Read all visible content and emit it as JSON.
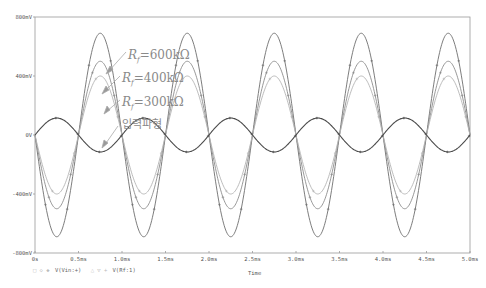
{
  "chart_data": {
    "type": "line",
    "title": "",
    "xlabel": "Time",
    "ylabel": "",
    "x_unit": "ms",
    "xlim": [
      0,
      5.0
    ],
    "ylim": [
      -800,
      800
    ],
    "y_unit": "mV",
    "grid": false,
    "x_ticks": [
      "0s",
      "0.5ms",
      "1.0ms",
      "1.5ms",
      "2.0ms",
      "2.5ms",
      "3.0ms",
      "3.5ms",
      "4.0ms",
      "4.5ms",
      "5.0ms"
    ],
    "y_ticks": [
      "800mV",
      "400mV",
      "0V",
      "-400mV",
      "-800mV"
    ],
    "frequency_hz": 1000,
    "series": [
      {
        "name": "Rf=600kΩ",
        "signal": "V(Rf:1)",
        "amplitude_mV": 690,
        "phase": "inverted",
        "color": "#6e6e6e"
      },
      {
        "name": "Rf=400kΩ",
        "signal": "V(Rf:1)",
        "amplitude_mV": 500,
        "phase": "inverted",
        "color": "#8c8c8c"
      },
      {
        "name": "Rf=300kΩ",
        "signal": "V(Rf:1)",
        "amplitude_mV": 400,
        "phase": "inverted",
        "color": "#b4b4b4"
      },
      {
        "name": "입력파형",
        "signal": "V(Vin:+)",
        "amplitude_mV": 115,
        "phase": "normal",
        "color": "#4a4a4a"
      }
    ],
    "annotations": [
      {
        "text_main": "R",
        "text_sub": "f",
        "text_rest": "=600kΩ",
        "x": 128,
        "y": 59
      },
      {
        "text_main": "R",
        "text_sub": "f",
        "text_rest": "=400kΩ",
        "x": 122,
        "y": 82
      },
      {
        "text_main": "R",
        "text_sub": "f",
        "text_rest": "=300kΩ",
        "x": 122,
        "y": 106
      },
      {
        "text": "입력파형",
        "x": 122,
        "y": 128
      }
    ],
    "legend": [
      {
        "label": "V(Vin:+)",
        "marker": "◇ ◇ ◆"
      },
      {
        "label": "V(Rf:1)",
        "marker": "△ △ +"
      }
    ]
  },
  "axis": {
    "x_label": "Time"
  },
  "legend": {
    "item1_marker": "□ ◇ ◆",
    "item1_label": "V(Vin:+)",
    "item2_marker": "△ ▽ +",
    "item2_label": "V(Rf:1)"
  },
  "annotation_labels": {
    "rf600": "=600kΩ",
    "rf400": "=400kΩ",
    "rf300": "=300kΩ",
    "input": "입력파형",
    "R": "R",
    "f": "f"
  }
}
